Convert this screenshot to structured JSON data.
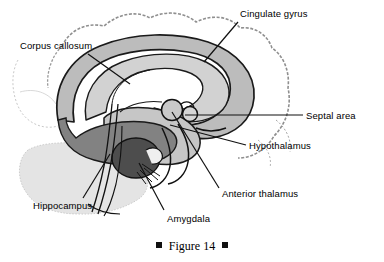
{
  "figure": {
    "caption_text": "Figure 14",
    "bullet_glyph": "square-bullet"
  },
  "labels": [
    {
      "id": "cingulate-gyrus",
      "text": "Cingulate gyrus",
      "x": 240,
      "y": 8,
      "leader": "M238,22 L204,62"
    },
    {
      "id": "corpus-callosum",
      "text": "Corpus callosum",
      "x": 20,
      "y": 40,
      "leader": "M88,54 L130,84"
    },
    {
      "id": "septal-area",
      "text": "Septal area",
      "x": 306,
      "y": 110,
      "leader": "M303,115 L185,115"
    },
    {
      "id": "hypothalamus",
      "text": "Hypothalamus",
      "x": 249,
      "y": 140,
      "leader": "M246,145 L170,125"
    },
    {
      "id": "anterior-thalamus",
      "text": "Anterior thalamus",
      "x": 222,
      "y": 188,
      "leader": "M219,188 L172,112"
    },
    {
      "id": "amygdala",
      "text": "Amygdala",
      "x": 167,
      "y": 213,
      "leader": "M164,210 L139,163"
    },
    {
      "id": "hippocampus",
      "text": "Hippocampus",
      "x": 33,
      "y": 200,
      "leader": "M83,198 L110,154"
    }
  ],
  "structures": [
    {
      "id": "cortex-outline",
      "name": "cerebral cortex outline",
      "tone": "#9a9a9a"
    },
    {
      "id": "cingulate-band",
      "name": "cingulate gyrus band",
      "tone": "#b9b9b9"
    },
    {
      "id": "corpus-callosum-body",
      "name": "corpus callosum",
      "tone": "#cfcfcf"
    },
    {
      "id": "hippocampus-body",
      "name": "hippocampus",
      "tone": "#7e7e7e"
    },
    {
      "id": "amygdala-body",
      "name": "amygdala",
      "tone": "#4f4f4f"
    },
    {
      "id": "thalamus-body",
      "name": "thalamus / hypothalamus",
      "tone": "#c4c4c4"
    },
    {
      "id": "cerebellum-ghost",
      "name": "cerebellum (faint)",
      "tone": "#dcdcdc"
    },
    {
      "id": "brainstem",
      "name": "brainstem",
      "tone": "#ffffff"
    }
  ],
  "colors": {
    "ink": "#111111",
    "light_gray": "#dcdcdc",
    "mid_gray": "#b9b9b9",
    "dark_gray": "#7e7e7e",
    "darkest_gray": "#4f4f4f",
    "background": "#ffffff"
  }
}
